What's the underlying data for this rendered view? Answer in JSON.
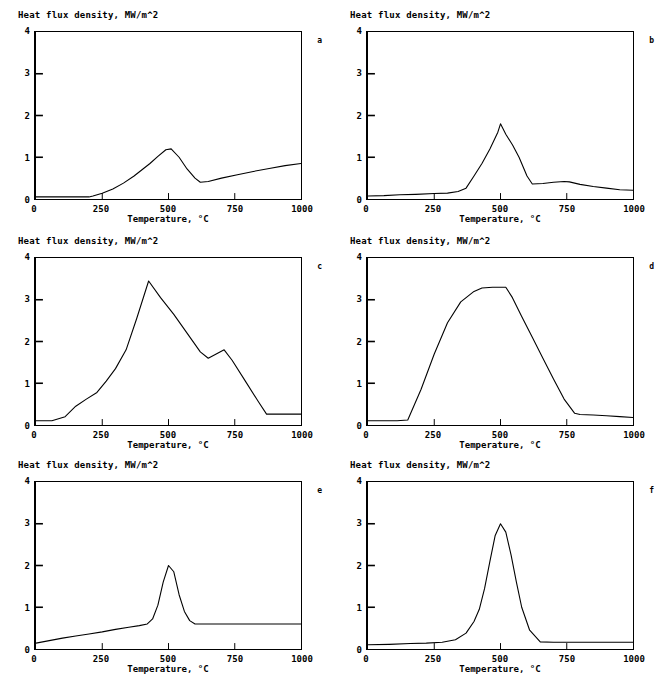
{
  "figure": {
    "axis_title_y": "Heat flux density,  MW/m^2",
    "axis_title_x": "Temperature, °C",
    "y_ticks": [
      "0",
      "1",
      "2",
      "3",
      "4"
    ],
    "x_ticks": [
      "0",
      "250",
      "500",
      "750",
      "1000"
    ],
    "quenchant_label": "Quenchant:",
    "qmax_label": "Qmax, W/m^2 =",
    "tmax_label": "Tmax, °C ="
  },
  "chart_data": [
    {
      "type": "line",
      "panel": "a",
      "title": "Heat flux density,  MW/m^2",
      "xlabel": "Temperature, °C",
      "ylabel": "Heat flux density, MW/m^2",
      "xlim": [
        0,
        1000
      ],
      "ylim": [
        0,
        4
      ],
      "grid": false,
      "legend": "inside-top",
      "quenchant": "06",
      "qmax": "1201000",
      "tmax": "493",
      "q_values": [
        {
          "label": "Q3, W/m^2 =",
          "value": "560542"
        },
        {
          "label": "Q4, W/m^2 =",
          "value": "1063146"
        },
        {
          "label": "Q5, W/m^2 =",
          "value": "706001"
        },
        {
          "label": "Q6, W/m^2 =",
          "value": "362845"
        }
      ],
      "x": [
        0,
        100,
        200,
        215,
        250,
        290,
        330,
        370,
        400,
        430,
        460,
        490,
        510,
        540,
        570,
        600,
        620,
        650,
        700,
        760,
        820,
        880,
        940,
        1000
      ],
      "y": [
        0.05,
        0.05,
        0.05,
        0.07,
        0.14,
        0.24,
        0.38,
        0.55,
        0.7,
        0.85,
        1.02,
        1.18,
        1.2,
        1.0,
        0.72,
        0.5,
        0.4,
        0.42,
        0.5,
        0.58,
        0.66,
        0.73,
        0.8,
        0.85
      ]
    },
    {
      "type": "line",
      "panel": "b",
      "title": "Heat flux density,  MW/m^2",
      "xlabel": "Temperature, °C",
      "ylabel": "Heat flux density, MW/m^2",
      "xlim": [
        0,
        1000
      ],
      "ylim": [
        0,
        4
      ],
      "grid": false,
      "legend": "inside-top",
      "quenchant": "07",
      "qmax": "1800000",
      "tmax": "500",
      "q_values": [
        {
          "label": "Q3, W/m^2 =",
          "value": "311500"
        },
        {
          "label": "Q4, W/m^2 =",
          "value": "1295000"
        },
        {
          "label": "Q5, W/m^2 =",
          "value": "1435624"
        },
        {
          "label": "Q6, W/m^2 =",
          "value": "502750"
        }
      ],
      "x": [
        0,
        60,
        120,
        180,
        250,
        300,
        340,
        370,
        400,
        430,
        460,
        490,
        500,
        520,
        545,
        570,
        600,
        620,
        660,
        700,
        740,
        760,
        800,
        850,
        900,
        950,
        1000
      ],
      "y": [
        0.07,
        0.08,
        0.1,
        0.11,
        0.13,
        0.14,
        0.18,
        0.26,
        0.55,
        0.85,
        1.2,
        1.6,
        1.8,
        1.55,
        1.3,
        1.0,
        0.55,
        0.36,
        0.37,
        0.4,
        0.42,
        0.41,
        0.35,
        0.3,
        0.26,
        0.22,
        0.21
      ]
    },
    {
      "type": "line",
      "panel": "c",
      "title": "Heat flux density,  MW/m^2",
      "xlabel": "Temperature, °C",
      "ylabel": "Heat flux density, MW/m^2",
      "xlim": [
        0,
        1000
      ],
      "ylim": [
        0,
        4
      ],
      "grid": false,
      "legend": "inside-top",
      "quenchant": "08",
      "qmax": "3450000",
      "tmax": "425",
      "q_values": [
        {
          "label": "Q3, W/m^2 =",
          "value": "2411499"
        },
        {
          "label": "Q4, W/m^2 =",
          "value": "3124144"
        },
        {
          "label": "Q5, W/m^2 =",
          "value": "2133857"
        },
        {
          "label": "Q6, W/m^2 =",
          "value": "1699000"
        },
        {
          "label": "Q7, W/m^2 =",
          "value": "1215200"
        }
      ],
      "x": [
        0,
        60,
        110,
        150,
        190,
        230,
        265,
        300,
        340,
        380,
        425,
        470,
        520,
        570,
        620,
        650,
        680,
        710,
        740,
        790,
        840,
        870,
        910,
        960,
        1000
      ],
      "y": [
        0.1,
        0.1,
        0.2,
        0.45,
        0.62,
        0.78,
        1.05,
        1.35,
        1.8,
        2.55,
        3.45,
        3.05,
        2.65,
        2.2,
        1.75,
        1.6,
        1.7,
        1.8,
        1.55,
        1.05,
        0.55,
        0.26,
        0.26,
        0.26,
        0.26
      ]
    },
    {
      "type": "line",
      "panel": "d",
      "title": "Heat flux density,  MW/m^2",
      "xlabel": "Temperature, °C",
      "ylabel": "Heat flux density, MW/m^2",
      "xlim": [
        0,
        1000
      ],
      "ylim": [
        0,
        4
      ],
      "grid": false,
      "legend": "inside-top",
      "quenchant": "W1",
      "qmax": "3300000",
      "tmax": "520",
      "q_values": [
        {
          "label": "Q3, W/m^2 =",
          "value": "3009887"
        },
        {
          "label": "Q4, W/m^2 =",
          "value": "3216071"
        },
        {
          "label": "Q5, W/m^2 =",
          "value": "3008978"
        },
        {
          "label": "Q6, W/m^2 =",
          "value": "2117600"
        },
        {
          "label": "Q7, W/m^2 =",
          "value": "707117"
        }
      ],
      "x": [
        0,
        60,
        110,
        150,
        200,
        250,
        300,
        350,
        400,
        430,
        470,
        500,
        520,
        545,
        580,
        620,
        660,
        700,
        740,
        780,
        800,
        850,
        900,
        950,
        1000
      ],
      "y": [
        0.1,
        0.1,
        0.1,
        0.12,
        0.85,
        1.7,
        2.45,
        2.95,
        3.2,
        3.28,
        3.3,
        3.3,
        3.3,
        3.05,
        2.6,
        2.1,
        1.6,
        1.1,
        0.62,
        0.28,
        0.25,
        0.24,
        0.22,
        0.2,
        0.18
      ]
    },
    {
      "type": "line",
      "panel": "e",
      "title": "Heat flux density,  MW/m^2",
      "xlabel": "Temperature, °C",
      "ylabel": "Heat flux density, MW/m^2",
      "xlim": [
        0,
        1000
      ],
      "ylim": [
        0,
        4
      ],
      "grid": false,
      "legend": "inside-top",
      "quenchant": "S1",
      "qmax": "2000000",
      "tmax": "500",
      "q_values": [
        {
          "label": "Q3, W/m^2 =",
          "value": "549500"
        },
        {
          "label": "Q4, W/m^2 =",
          "value": "1290721"
        },
        {
          "label": "Q5, W/m^2 =",
          "value": "1304721"
        },
        {
          "label": "Q6, W/m^2 =",
          "value": "600000"
        },
        {
          "label": "Q7, W/m^2 =",
          "value": "600000"
        }
      ],
      "x": [
        0,
        50,
        100,
        150,
        200,
        250,
        300,
        350,
        390,
        420,
        440,
        460,
        480,
        500,
        520,
        540,
        560,
        580,
        600,
        650,
        700,
        800,
        900,
        1000
      ],
      "y": [
        0.14,
        0.2,
        0.26,
        0.31,
        0.36,
        0.41,
        0.47,
        0.52,
        0.56,
        0.6,
        0.72,
        1.05,
        1.6,
        2.0,
        1.85,
        1.3,
        0.9,
        0.68,
        0.6,
        0.6,
        0.6,
        0.6,
        0.6,
        0.6
      ]
    },
    {
      "type": "line",
      "panel": "f",
      "title": "Heat flux density,  MW/m^2",
      "xlabel": "Temperature, °C",
      "ylabel": "Heat flux density, MW/m^2",
      "xlim": [
        0,
        1000
      ],
      "ylim": [
        0,
        4
      ],
      "grid": false,
      "legend": "inside-top",
      "quenchant": "S2",
      "qmax": "3000000",
      "tmax": "500",
      "q_values": [
        {
          "label": "Q3, W/m^2 =",
          "value": "357707"
        },
        {
          "label": "Q4, W/m^2 =",
          "value": "1648715"
        },
        {
          "label": "Q5, W/m^2 =",
          "value": "1672715"
        },
        {
          "label": "Q6, W/m^2 =",
          "value": "364350"
        },
        {
          "label": "Q7, W/m^2 =",
          "value": "300000"
        }
      ],
      "x": [
        0,
        80,
        160,
        220,
        280,
        330,
        370,
        400,
        420,
        440,
        460,
        480,
        500,
        520,
        540,
        560,
        580,
        610,
        650,
        700,
        780,
        860,
        940,
        1000
      ],
      "y": [
        0.1,
        0.11,
        0.13,
        0.14,
        0.16,
        0.22,
        0.38,
        0.66,
        0.95,
        1.45,
        2.1,
        2.72,
        3.0,
        2.8,
        2.25,
        1.6,
        1.0,
        0.45,
        0.17,
        0.16,
        0.16,
        0.16,
        0.16,
        0.16
      ]
    }
  ]
}
